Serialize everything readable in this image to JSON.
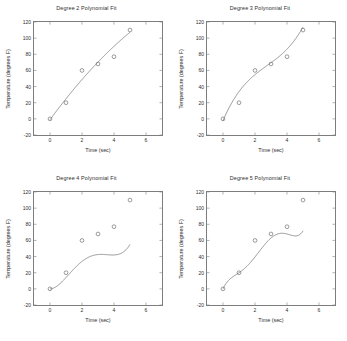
{
  "figure": {
    "layout": "2x2 subplot grid",
    "panels": [
      {
        "id": "degree-2",
        "title": "Degree 2 Polynomial Fit"
      },
      {
        "id": "degree-3",
        "title": "Degree 3 Polynomial Fit"
      },
      {
        "id": "degree-4",
        "title": "Degree 4 Polynomial Fit"
      },
      {
        "id": "degree-5",
        "title": "Degree 5 Polynomial Fit"
      }
    ]
  },
  "chart_data": [
    {
      "type": "scatter",
      "title": "Degree 2 Polynomial Fit",
      "xlabel": "Time (sec)",
      "ylabel": "Temperature (degrees F)",
      "xlim": [
        -1,
        7
      ],
      "ylim": [
        -20,
        120
      ],
      "xticks": [
        0,
        2,
        4,
        6
      ],
      "yticks": [
        -20,
        0,
        20,
        40,
        60,
        80,
        100,
        120
      ],
      "grid": false,
      "legend": "none",
      "marker": "open-circle",
      "x": [
        0,
        1,
        2,
        3,
        4,
        5
      ],
      "y": [
        0,
        20,
        60,
        68,
        77,
        110
      ],
      "fit_degree": 2,
      "fit_coeffs": [
        -1.0714,
        27.0357,
        -1.1071
      ],
      "fit_label": "quadratic least-squares fit"
    },
    {
      "type": "scatter",
      "title": "Degree 3 Polynomial Fit",
      "xlabel": "Time (sec)",
      "ylabel": "Temperature (degrees F)",
      "xlim": [
        -1,
        7
      ],
      "ylim": [
        -20,
        120
      ],
      "xticks": [
        0,
        2,
        4,
        6
      ],
      "yticks": [
        -20,
        0,
        20,
        40,
        60,
        80,
        100,
        120
      ],
      "grid": false,
      "legend": "none",
      "marker": "open-circle",
      "x": [
        0,
        1,
        2,
        3,
        4,
        5
      ],
      "y": [
        0,
        20,
        60,
        68,
        77,
        110
      ],
      "fit_degree": 3,
      "fit_coeffs": [
        1.4074,
        -11.619,
        46.082,
        -2.1429
      ],
      "fit_label": "cubic least-squares fit"
    },
    {
      "type": "scatter",
      "title": "Degree 4 Polynomial Fit",
      "xlabel": "Time (sec)",
      "ylabel": "Temperature (degrees F)",
      "xlim": [
        -1,
        7
      ],
      "ylim": [
        -20,
        120
      ],
      "xticks": [
        0,
        2,
        4,
        6
      ],
      "yticks": [
        -20,
        0,
        20,
        40,
        60,
        80,
        100,
        120
      ],
      "grid": false,
      "legend": "none",
      "marker": "open-circle",
      "x": [
        0,
        1,
        2,
        3,
        4,
        5
      ],
      "y": [
        0,
        20,
        60,
        68,
        77,
        110
      ],
      "fit_degree": 4,
      "fit_coeffs": [
        0.8333,
        -7.9167,
        20.9167,
        0.1667,
        0.0
      ],
      "fit_label": "quartic least-squares fit"
    },
    {
      "type": "scatter",
      "title": "Degree 5 Polynomial Fit",
      "xlabel": "Time (sec)",
      "ylabel": "Temperature (degrees F)",
      "xlim": [
        -1,
        7
      ],
      "ylim": [
        -20,
        120
      ],
      "xticks": [
        0,
        2,
        4,
        6
      ],
      "yticks": [
        -20,
        0,
        20,
        40,
        60,
        80,
        100,
        120
      ],
      "grid": false,
      "legend": "none",
      "marker": "open-circle",
      "x": [
        0,
        1,
        2,
        3,
        4,
        5
      ],
      "y": [
        0,
        20,
        60,
        68,
        77,
        110
      ],
      "fit_degree": 5,
      "fit_coeffs": [
        0.5583,
        -6.7083,
        27.0417,
        -42.7917,
        41.9,
        0.0
      ],
      "fit_label": "quintic interpolating fit"
    }
  ],
  "axis_text": {
    "xlabel": "Time (sec)",
    "ylabel": "Temperature (degrees F)"
  },
  "colors": {
    "axis": "#7d7d7d",
    "curve": "#6f6f6f",
    "marker": "#6f6f6f",
    "text": "#2e2e2e",
    "background": "#ffffff"
  }
}
